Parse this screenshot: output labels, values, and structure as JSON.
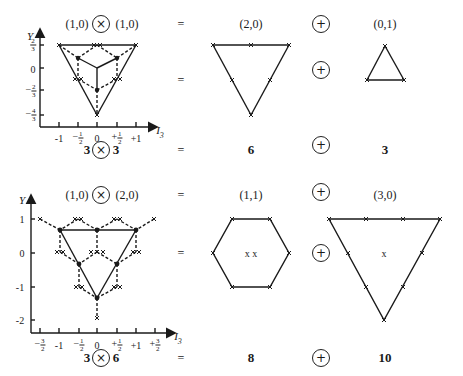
{
  "top_row": {
    "equation": {
      "lhs_left": "(1,0)",
      "op_times": "×",
      "lhs_right": "(1,0)",
      "equals": "=",
      "rep1": "(2,0)",
      "op_plus": "+",
      "rep2": "(0,1)"
    },
    "dims": {
      "lhs_left": "3",
      "op_times": "×",
      "lhs_right": "3",
      "equals": "=",
      "rep1": "6",
      "op_plus": "+",
      "rep2": "3"
    },
    "axes": {
      "y_label": "Y",
      "x_label": "I",
      "x_sub": "3",
      "y_ticks": [
        "2/3",
        "0",
        "-2/3",
        "-4/3"
      ],
      "x_ticks": [
        "-1",
        "-1/2",
        "0",
        "+1/2",
        "+1"
      ]
    }
  },
  "bottom_row": {
    "equation": {
      "lhs_left": "(1,0)",
      "op_times": "×",
      "lhs_right": "(2,0)",
      "equals": "=",
      "rep1": "(1,1)",
      "op_plus": "+",
      "rep2": "(3,0)"
    },
    "dims": {
      "lhs_left": "3",
      "op_times": "×",
      "lhs_right": "6",
      "equals": "=",
      "rep1": "8",
      "op_plus": "+",
      "rep2": "10"
    },
    "axes": {
      "y_label": "Y",
      "x_label": "I",
      "x_sub": "3",
      "y_ticks": [
        "1",
        "0",
        "-1",
        "-2"
      ],
      "x_ticks": [
        "-3/2",
        "-1",
        "-1/2",
        "0",
        "+1/2",
        "+1",
        "+3/2"
      ]
    }
  },
  "center_marks": {
    "octet_center": "x x",
    "decuplet_center": "x"
  },
  "colors": {
    "ink": "#1a1a1a",
    "background": "#ffffff"
  }
}
